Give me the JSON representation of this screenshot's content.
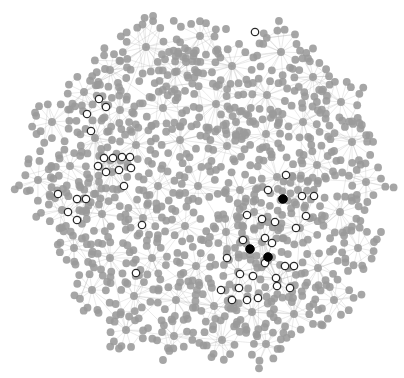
{
  "figure": {
    "type": "network-graph",
    "title": "",
    "width": 404,
    "height": 378,
    "background_color": "#ffffff",
    "layout": "force-directed"
  },
  "style": {
    "node_default_fill": "#9a9a9a",
    "node_default_stroke": "#9a9a9a",
    "node_highlight_fill": "#ffffff",
    "node_highlight_stroke": "#2a2a2a",
    "node_selected_fill": "#000000",
    "node_selected_stroke": "#000000",
    "edge_color": "#b4b4b4",
    "node_radius": 3.9,
    "node_highlight_radius": 3.7,
    "node_highlight_stroke_width": 1.25,
    "edge_width": 0.45,
    "edge_opacity": 0.62,
    "node_opacity": 0.88
  },
  "legend": {
    "visible": false,
    "entries": [
      {
        "label": "node",
        "color": "#9a9a9a",
        "state": "default"
      },
      {
        "label": "highlighted node",
        "color": "#ffffff",
        "state": "highlighted"
      },
      {
        "label": "selected node",
        "color": "#000000",
        "state": "selected"
      }
    ]
  },
  "chart_data": {
    "type": "scatter",
    "title": "",
    "xlabel": "",
    "ylabel": "",
    "grid": false,
    "axes_visible": false,
    "xlim": [
      0,
      404
    ],
    "ylim": [
      0,
      378
    ],
    "counts": {
      "total_nodes": 1512,
      "clusters": 96,
      "highlighted_nodes": 40,
      "selected_nodes": 3
    },
    "clusters": [
      {
        "cx": 146,
        "cy": 47,
        "r": 25,
        "n": 22,
        "arms": 15
      },
      {
        "cx": 200,
        "cy": 36,
        "r": 19,
        "n": 15,
        "arms": 11
      },
      {
        "cx": 110,
        "cy": 70,
        "r": 17,
        "n": 13,
        "arms": 10
      },
      {
        "cx": 175,
        "cy": 72,
        "r": 20,
        "n": 16,
        "arms": 12
      },
      {
        "cx": 232,
        "cy": 66,
        "r": 21,
        "n": 17,
        "arms": 12
      },
      {
        "cx": 281,
        "cy": 52,
        "r": 22,
        "n": 18,
        "arms": 13
      },
      {
        "cx": 313,
        "cy": 77,
        "r": 20,
        "n": 16,
        "arms": 12
      },
      {
        "cx": 267,
        "cy": 95,
        "r": 19,
        "n": 15,
        "arms": 11
      },
      {
        "cx": 216,
        "cy": 104,
        "r": 22,
        "n": 18,
        "arms": 13
      },
      {
        "cx": 163,
        "cy": 108,
        "r": 18,
        "n": 14,
        "arms": 10
      },
      {
        "cx": 120,
        "cy": 110,
        "r": 17,
        "n": 13,
        "arms": 10
      },
      {
        "cx": 84,
        "cy": 92,
        "r": 15,
        "n": 12,
        "arms": 9
      },
      {
        "cx": 52,
        "cy": 122,
        "r": 20,
        "n": 16,
        "arms": 12
      },
      {
        "cx": 95,
        "cy": 138,
        "r": 16,
        "n": 13,
        "arms": 10
      },
      {
        "cx": 136,
        "cy": 145,
        "r": 19,
        "n": 15,
        "arms": 11
      },
      {
        "cx": 180,
        "cy": 140,
        "r": 18,
        "n": 14,
        "arms": 10
      },
      {
        "cx": 227,
        "cy": 146,
        "r": 19,
        "n": 15,
        "arms": 11
      },
      {
        "cx": 266,
        "cy": 134,
        "r": 18,
        "n": 14,
        "arms": 10
      },
      {
        "cx": 303,
        "cy": 122,
        "r": 19,
        "n": 15,
        "arms": 11
      },
      {
        "cx": 341,
        "cy": 102,
        "r": 20,
        "n": 16,
        "arms": 12
      },
      {
        "cx": 352,
        "cy": 142,
        "r": 21,
        "n": 17,
        "arms": 12
      },
      {
        "cx": 317,
        "cy": 165,
        "r": 19,
        "n": 15,
        "arms": 11
      },
      {
        "cx": 277,
        "cy": 177,
        "r": 20,
        "n": 16,
        "arms": 12
      },
      {
        "cx": 240,
        "cy": 190,
        "r": 18,
        "n": 14,
        "arms": 10
      },
      {
        "cx": 198,
        "cy": 186,
        "r": 19,
        "n": 15,
        "arms": 11
      },
      {
        "cx": 158,
        "cy": 186,
        "r": 17,
        "n": 13,
        "arms": 10
      },
      {
        "cx": 112,
        "cy": 172,
        "r": 18,
        "n": 14,
        "arms": 10
      },
      {
        "cx": 70,
        "cy": 166,
        "r": 17,
        "n": 13,
        "arms": 10
      },
      {
        "cx": 38,
        "cy": 180,
        "r": 18,
        "n": 14,
        "arms": 10
      },
      {
        "cx": 62,
        "cy": 210,
        "r": 19,
        "n": 15,
        "arms": 11
      },
      {
        "cx": 102,
        "cy": 214,
        "r": 18,
        "n": 14,
        "arms": 10
      },
      {
        "cx": 143,
        "cy": 218,
        "r": 17,
        "n": 13,
        "arms": 10
      },
      {
        "cx": 185,
        "cy": 226,
        "r": 19,
        "n": 15,
        "arms": 11
      },
      {
        "cx": 226,
        "cy": 232,
        "r": 18,
        "n": 14,
        "arms": 10
      },
      {
        "cx": 262,
        "cy": 242,
        "r": 20,
        "n": 16,
        "arms": 12
      },
      {
        "cx": 300,
        "cy": 228,
        "r": 19,
        "n": 15,
        "arms": 11
      },
      {
        "cx": 340,
        "cy": 212,
        "r": 20,
        "n": 16,
        "arms": 12
      },
      {
        "cx": 366,
        "cy": 182,
        "r": 18,
        "n": 14,
        "arms": 10
      },
      {
        "cx": 358,
        "cy": 248,
        "r": 19,
        "n": 15,
        "arms": 11
      },
      {
        "cx": 318,
        "cy": 268,
        "r": 18,
        "n": 14,
        "arms": 10
      },
      {
        "cx": 278,
        "cy": 280,
        "r": 19,
        "n": 15,
        "arms": 11
      },
      {
        "cx": 238,
        "cy": 272,
        "r": 17,
        "n": 13,
        "arms": 10
      },
      {
        "cx": 196,
        "cy": 266,
        "r": 18,
        "n": 14,
        "arms": 10
      },
      {
        "cx": 152,
        "cy": 258,
        "r": 18,
        "n": 14,
        "arms": 10
      },
      {
        "cx": 110,
        "cy": 258,
        "r": 18,
        "n": 14,
        "arms": 10
      },
      {
        "cx": 74,
        "cy": 248,
        "r": 17,
        "n": 13,
        "arms": 10
      },
      {
        "cx": 92,
        "cy": 290,
        "r": 19,
        "n": 15,
        "arms": 11
      },
      {
        "cx": 134,
        "cy": 296,
        "r": 18,
        "n": 14,
        "arms": 10
      },
      {
        "cx": 176,
        "cy": 300,
        "r": 18,
        "n": 14,
        "arms": 10
      },
      {
        "cx": 214,
        "cy": 306,
        "r": 17,
        "n": 13,
        "arms": 10
      },
      {
        "cx": 252,
        "cy": 312,
        "r": 18,
        "n": 14,
        "arms": 10
      },
      {
        "cx": 294,
        "cy": 314,
        "r": 19,
        "n": 15,
        "arms": 11
      },
      {
        "cx": 334,
        "cy": 300,
        "r": 18,
        "n": 14,
        "arms": 10
      },
      {
        "cx": 126,
        "cy": 330,
        "r": 18,
        "n": 14,
        "arms": 10
      },
      {
        "cx": 174,
        "cy": 336,
        "r": 17,
        "n": 13,
        "arms": 10
      },
      {
        "cx": 222,
        "cy": 340,
        "r": 17,
        "n": 13,
        "arms": 10
      },
      {
        "cx": 266,
        "cy": 344,
        "r": 16,
        "n": 12,
        "arms": 9
      },
      {
        "cx": 94,
        "cy": 194,
        "r": 14,
        "n": 11,
        "arms": 8
      },
      {
        "cx": 236,
        "cy": 122,
        "r": 15,
        "n": 12,
        "arms": 9
      },
      {
        "cx": 186,
        "cy": 62,
        "r": 14,
        "n": 11,
        "arms": 8
      },
      {
        "cx": 298,
        "cy": 190,
        "r": 16,
        "n": 13,
        "arms": 10
      },
      {
        "cx": 254,
        "cy": 212,
        "r": 16,
        "n": 13,
        "arms": 10
      }
    ],
    "highlighted_nodes": [
      {
        "x": 255,
        "y": 32
      },
      {
        "x": 99,
        "y": 99
      },
      {
        "x": 106,
        "y": 107
      },
      {
        "x": 87,
        "y": 114
      },
      {
        "x": 91,
        "y": 131
      },
      {
        "x": 104,
        "y": 158
      },
      {
        "x": 113,
        "y": 158
      },
      {
        "x": 122,
        "y": 157
      },
      {
        "x": 130,
        "y": 157
      },
      {
        "x": 98,
        "y": 166
      },
      {
        "x": 106,
        "y": 172
      },
      {
        "x": 119,
        "y": 170
      },
      {
        "x": 131,
        "y": 168
      },
      {
        "x": 124,
        "y": 186
      },
      {
        "x": 58,
        "y": 194
      },
      {
        "x": 77,
        "y": 199
      },
      {
        "x": 86,
        "y": 199
      },
      {
        "x": 68,
        "y": 212
      },
      {
        "x": 77,
        "y": 220
      },
      {
        "x": 142,
        "y": 225
      },
      {
        "x": 136,
        "y": 273
      },
      {
        "x": 268,
        "y": 190
      },
      {
        "x": 286,
        "y": 175
      },
      {
        "x": 302,
        "y": 196
      },
      {
        "x": 314,
        "y": 196
      },
      {
        "x": 306,
        "y": 216
      },
      {
        "x": 247,
        "y": 215
      },
      {
        "x": 262,
        "y": 219
      },
      {
        "x": 275,
        "y": 222
      },
      {
        "x": 296,
        "y": 228
      },
      {
        "x": 243,
        "y": 240
      },
      {
        "x": 265,
        "y": 238
      },
      {
        "x": 272,
        "y": 243
      },
      {
        "x": 227,
        "y": 258
      },
      {
        "x": 265,
        "y": 263
      },
      {
        "x": 285,
        "y": 266
      },
      {
        "x": 294,
        "y": 266
      },
      {
        "x": 240,
        "y": 274
      },
      {
        "x": 276,
        "y": 278
      },
      {
        "x": 239,
        "y": 288
      },
      {
        "x": 253,
        "y": 276
      },
      {
        "x": 277,
        "y": 286
      },
      {
        "x": 290,
        "y": 288
      },
      {
        "x": 221,
        "y": 290
      },
      {
        "x": 232,
        "y": 300
      },
      {
        "x": 247,
        "y": 300
      },
      {
        "x": 258,
        "y": 298
      }
    ],
    "selected_nodes": [
      {
        "x": 283,
        "y": 199
      },
      {
        "x": 250,
        "y": 249
      },
      {
        "x": 268,
        "y": 257
      }
    ],
    "isolated_nodes": [
      {
        "x": 163,
        "y": 360
      },
      {
        "x": 105,
        "y": 69
      },
      {
        "x": 169,
        "y": 52
      },
      {
        "x": 226,
        "y": 29
      },
      {
        "x": 381,
        "y": 232
      },
      {
        "x": 374,
        "y": 242
      }
    ]
  }
}
